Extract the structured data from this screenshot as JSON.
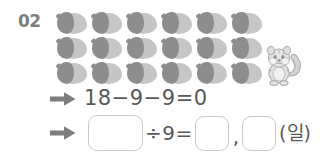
{
  "problem": {
    "number": "02",
    "unit_label": "(일)"
  },
  "manipulatives": {
    "icon": "acorn-icon",
    "rows": 3,
    "columns": 6,
    "total": 18,
    "cap_color": "#8d8d8d",
    "body_color": "#c6c6c6"
  },
  "mascot": {
    "icon": "chipmunk-icon",
    "color": "#b9b9b9"
  },
  "equation_row_1": {
    "arrow_icon": "right-arrow-icon",
    "expression": "18−9−9=0"
  },
  "equation_row_2": {
    "arrow_icon": "right-arrow-icon",
    "blank_1": "",
    "operator": "÷9=",
    "blank_2": "",
    "separator": ",",
    "blank_3": "",
    "unit": "(일)"
  },
  "colors": {
    "text": "#58585a",
    "number_label": "#7d7d7d",
    "box_border": "#c9c9c9",
    "arrow": "#7e7e80",
    "background": "#ffffff"
  }
}
